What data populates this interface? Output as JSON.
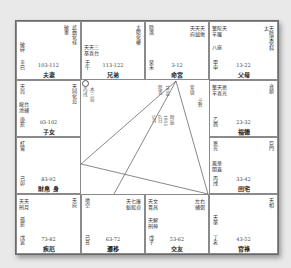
{
  "chart": {
    "palaces": [
      {
        "id": "si",
        "stars_right": [
          "武曲化祿",
          "破軍"
        ],
        "stars_left": [
          "破碎"
        ],
        "minor": [
          "巾包"
        ],
        "range": "103-112",
        "name": "夫妻",
        "stem": "辛巳"
      },
      {
        "id": "wu",
        "stars_right": [
          "太陽化權"
        ],
        "stars_left": [
          "天天三",
          "巫喜台"
        ],
        "minor": [],
        "range": "113-122",
        "name": "兄弟",
        "stem": "壬午"
      },
      {
        "id": "wei",
        "stars_right": [
          "天天天",
          "府鉞傷"
        ],
        "stars_left": [
          "陰煞"
        ],
        "minor": [],
        "range": "3-12",
        "name": "命宮",
        "stem": "癸未"
      },
      {
        "id": "shen",
        "stars_right": [
          "太天",
          "陰梁化科"
        ],
        "stars_left": [
          "擎陀天",
          "羊羅",
          "八座"
        ],
        "minor": [],
        "range": "13-22",
        "name": "父母",
        "stem": "甲申"
      },
      {
        "id": "chen",
        "stars_right": [
          "天同化忌"
        ],
        "stars_left": [
          "天尚",
          "龍台",
          "池輔"
        ],
        "minor": [],
        "range": "93-102",
        "name": "子女",
        "stem": "庚辰"
      },
      {
        "id": "you",
        "stars_right": [
          "貪狼"
        ],
        "stars_left": [
          "擎天恩",
          "羊喜光"
        ],
        "minor": [],
        "range": "23-32",
        "name": "福德",
        "stem": "乙酉"
      },
      {
        "id": "mao",
        "stars_right": [],
        "stars_left": [
          "紅鸞"
        ],
        "minor": [],
        "range": "83-92",
        "name": "財帛 身",
        "stem": "己卯"
      },
      {
        "id": "xu",
        "stars_right": [
          "巨門"
        ],
        "stars_left": [
          "恩光",
          "鳳華",
          "閣蓋"
        ],
        "minor": [],
        "range": "33-42",
        "name": "田宅",
        "stem": "丙戌"
      },
      {
        "id": "yin",
        "stars_right": [
          "天府"
        ],
        "stars_left": [
          "天天",
          "刑月",
          "孤辰"
        ],
        "minor": [],
        "range": "73-82",
        "name": "疾厄",
        "stem": "戊寅"
      },
      {
        "id": "chou",
        "stars_right": [
          "天七廉",
          "魁殺貞"
        ],
        "stars_left": [
          "地空"
        ],
        "minor": [],
        "range": "63-72",
        "name": "遷移",
        "stem": "己丑"
      },
      {
        "id": "zi",
        "stars_right": [
          "左右",
          "輔弼"
        ],
        "stars_left": [
          "天文",
          "貴昌",
          "天解",
          "刑神"
        ],
        "minor": [],
        "range": "53-62",
        "name": "交友",
        "stem": "戊子"
      },
      {
        "id": "hai",
        "stars_right": [
          "天相"
        ],
        "stars_left": [
          "天巫"
        ],
        "minor": [],
        "range": "43-52",
        "name": "官祿",
        "stem": "丁亥"
      }
    ],
    "center": {
      "left_column": [
        "○子年",
        "丙戌",
        "木三局"
      ],
      "middle_columns": [
        "陰男",
        "1950",
        "年命",
        "干支",
        "5月",
        "6日",
        "1951",
        "生年",
        "時辰"
      ],
      "right_column": [
        "紫微",
        "斗數"
      ]
    },
    "lines": {
      "apex": [
        175,
        80
      ],
      "targets": [
        [
          80,
          163
        ],
        [
          113,
          193
        ],
        [
          207,
          193
        ]
      ],
      "extra": [
        [
          80,
          163
        ],
        [
          207,
          193
        ]
      ]
    }
  }
}
